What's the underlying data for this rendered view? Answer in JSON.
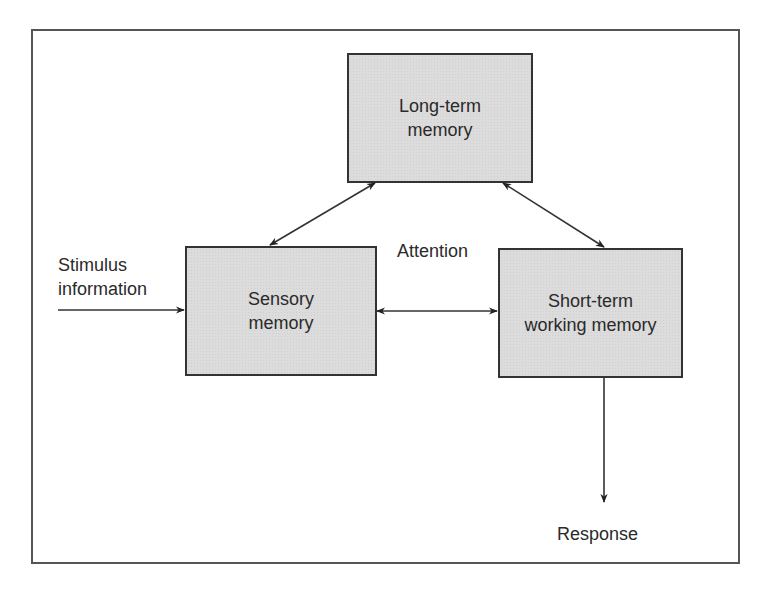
{
  "diagram": {
    "type": "flow-diagram",
    "colors": {
      "box_fill": "#dcdcdc",
      "box_border": "#333333",
      "line": "#333333",
      "frame": "#555555",
      "background": "#ffffff"
    },
    "nodes": [
      {
        "id": "long_term",
        "line1": "Long-term",
        "line2": "memory"
      },
      {
        "id": "sensory",
        "line1": "Sensory",
        "line2": "memory"
      },
      {
        "id": "short_term",
        "line1": "Short-term",
        "line2": "working memory"
      }
    ],
    "labels": {
      "stimulus_line1": "Stimulus",
      "stimulus_line2": "information",
      "attention": "Attention",
      "response": "Response"
    },
    "edges": [
      {
        "from": "stimulus",
        "to": "sensory",
        "direction": "one-way"
      },
      {
        "from": "sensory",
        "to": "long_term",
        "direction": "two-way"
      },
      {
        "from": "long_term",
        "to": "short_term",
        "direction": "two-way"
      },
      {
        "from": "sensory",
        "to": "short_term",
        "direction": "two-way",
        "label": "Attention"
      },
      {
        "from": "short_term",
        "to": "response",
        "direction": "one-way"
      }
    ]
  }
}
